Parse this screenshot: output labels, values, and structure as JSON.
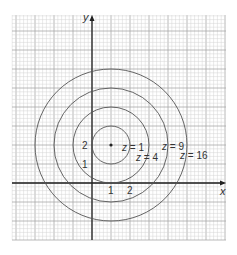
{
  "figure": {
    "axes": {
      "x_label": "x",
      "y_label": "y",
      "x_ticks": [
        {
          "value": 1,
          "label": "1"
        },
        {
          "value": 2,
          "label": "2"
        }
      ],
      "y_ticks": [
        {
          "value": 1,
          "label": "1"
        },
        {
          "value": 2,
          "label": "2"
        }
      ]
    },
    "center": {
      "x": 1,
      "y": 2
    },
    "contours": [
      {
        "z": 1,
        "radius": 1,
        "label": "z = 1"
      },
      {
        "z": 4,
        "radius": 2,
        "label": "z = 4"
      },
      {
        "z": 9,
        "radius": 3,
        "label": "z = 9"
      },
      {
        "z": 16,
        "radius": 4,
        "label": "z = 16"
      }
    ],
    "colors": {
      "grid_minor": "#d4d4d4",
      "grid_major": "#a8a8a8",
      "axis": "#222222",
      "contour": "#555555",
      "text": "#333333"
    }
  }
}
